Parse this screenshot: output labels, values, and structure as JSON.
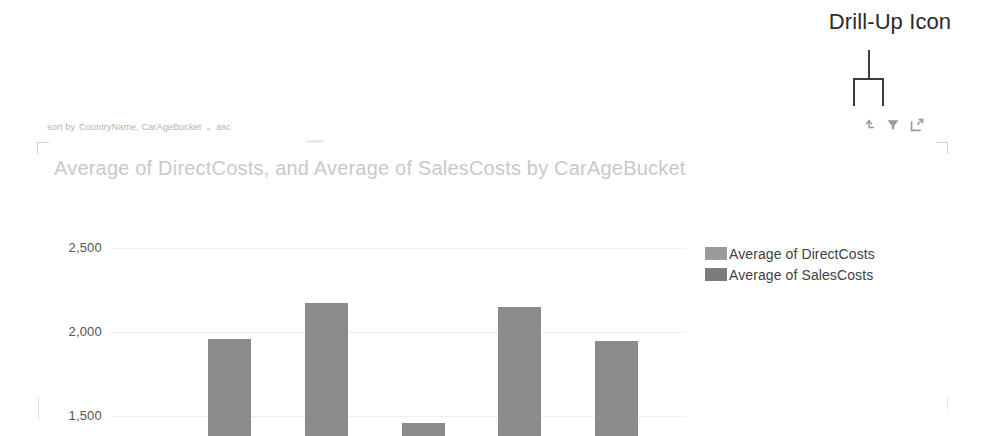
{
  "annotation": {
    "label": "Drill-Up Icon",
    "pointer_target": "drill-up-icon"
  },
  "sort_bar": {
    "prefix": "sort by",
    "field": "CountryName, CarAgeBucket",
    "caret": "⌄",
    "direction": "asc"
  },
  "visual_header": {
    "icons": [
      {
        "name": "drill-up-icon",
        "tooltip": "Drill Up"
      },
      {
        "name": "filter-icon",
        "tooltip": "Filters"
      },
      {
        "name": "focus-mode-icon",
        "tooltip": "Focus mode"
      }
    ]
  },
  "colors": {
    "bar": "#8b8b8b",
    "legend_direct": "#9a9a9a",
    "legend_sales": "#7c7c7c",
    "title": "#c9c9c9",
    "gridline": "#efefef",
    "axis_label": "#555555",
    "annotation": "#2b2b2b"
  },
  "chart_data": {
    "type": "bar",
    "title": "Average of DirectCosts, and Average of SalesCosts by CarAgeBucket",
    "xlabel": "",
    "ylabel": "",
    "ylim": [
      1380,
      2600
    ],
    "grid": true,
    "yticks": [
      2500,
      2000,
      1500
    ],
    "ytick_labels": [
      "2,500",
      "2,000",
      "1,500"
    ],
    "legend_position": "right",
    "legend": [
      "Average of DirectCosts",
      "Average of SalesCosts"
    ],
    "categories": [
      "1",
      "2",
      "3",
      "4",
      "5"
    ],
    "series": [
      {
        "name": "Average of SalesCosts",
        "values": [
          1960,
          2170,
          1455,
          2150,
          1945
        ]
      }
    ],
    "note": "Bars are clipped by the bottom edge of the screenshot; only the upper portion of each column is visible."
  }
}
